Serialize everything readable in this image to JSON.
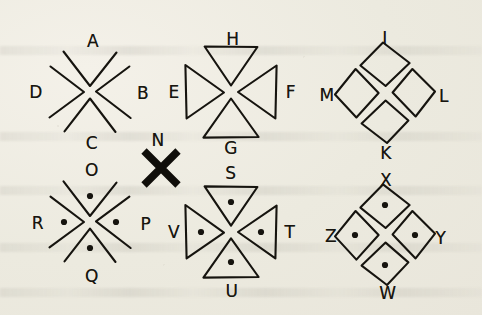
{
  "figure": {
    "background_color": "#efece4",
    "ink_color": "#16140f",
    "width": 482,
    "height": 315
  },
  "clusters": [
    {
      "id": "cluster-1",
      "shape_kind": "open-chevron-wedge",
      "has_center_dots": false,
      "center": {
        "x": 90,
        "y": 92
      },
      "labels": {
        "top": "A",
        "left": "D",
        "right": "B",
        "bottom": "C"
      }
    },
    {
      "id": "cluster-2",
      "shape_kind": "solid-outline-triangle",
      "has_center_dots": false,
      "center": {
        "x": 231,
        "y": 92
      },
      "labels": {
        "top": "H",
        "left": "E",
        "right": "F",
        "bottom": "G"
      }
    },
    {
      "id": "cluster-3",
      "shape_kind": "kite-quadrilateral",
      "has_center_dots": false,
      "center": {
        "x": 385,
        "y": 93
      },
      "labels": {
        "top": "I",
        "left": "M",
        "right": "L",
        "bottom": "K"
      }
    },
    {
      "id": "cluster-4",
      "shape_kind": "open-chevron-wedge",
      "has_center_dots": true,
      "center": {
        "x": 90,
        "y": 222
      },
      "labels": {
        "top": "O",
        "left": "R",
        "right": "P",
        "bottom": "Q"
      }
    },
    {
      "id": "cluster-5",
      "shape_kind": "solid-outline-triangle",
      "has_center_dots": true,
      "center": {
        "x": 231,
        "y": 232
      },
      "labels": {
        "top": "S",
        "left": "V",
        "right": "T",
        "bottom": "U"
      }
    },
    {
      "id": "cluster-6",
      "shape_kind": "kite-quadrilateral",
      "has_center_dots": true,
      "center": {
        "x": 385,
        "y": 235
      },
      "labels": {
        "top": "X",
        "left": "Z",
        "right": "Y",
        "bottom": "W"
      }
    }
  ],
  "standalone_mark": {
    "id": "bold-x-mark",
    "glyph": "X",
    "style": "bold-solid-cross",
    "center": {
      "x": 161,
      "y": 168
    },
    "label": "N",
    "label_position": {
      "x": 158,
      "y": 140
    }
  },
  "labels": [
    {
      "text": "A",
      "x": 93,
      "y": 41
    },
    {
      "text": "D",
      "x": 36,
      "y": 92
    },
    {
      "text": "B",
      "x": 143,
      "y": 93
    },
    {
      "text": "C",
      "x": 92,
      "y": 143
    },
    {
      "text": "H",
      "x": 233,
      "y": 39
    },
    {
      "text": "E",
      "x": 174,
      "y": 92
    },
    {
      "text": "F",
      "x": 291,
      "y": 92
    },
    {
      "text": "G",
      "x": 231,
      "y": 148
    },
    {
      "text": "I",
      "x": 385,
      "y": 38
    },
    {
      "text": "M",
      "x": 327,
      "y": 95
    },
    {
      "text": "L",
      "x": 444,
      "y": 96
    },
    {
      "text": "K",
      "x": 386,
      "y": 153
    },
    {
      "text": "N",
      "x": 158,
      "y": 140
    },
    {
      "text": "O",
      "x": 92,
      "y": 170
    },
    {
      "text": "R",
      "x": 38,
      "y": 223
    },
    {
      "text": "P",
      "x": 146,
      "y": 224
    },
    {
      "text": "Q",
      "x": 92,
      "y": 276
    },
    {
      "text": "S",
      "x": 231,
      "y": 173
    },
    {
      "text": "V",
      "x": 174,
      "y": 232
    },
    {
      "text": "T",
      "x": 290,
      "y": 232
    },
    {
      "text": "U",
      "x": 232,
      "y": 291
    },
    {
      "text": "X",
      "x": 386,
      "y": 180
    },
    {
      "text": "Z",
      "x": 331,
      "y": 236
    },
    {
      "text": "Y",
      "x": 441,
      "y": 238
    },
    {
      "text": "W",
      "x": 388,
      "y": 293
    }
  ]
}
